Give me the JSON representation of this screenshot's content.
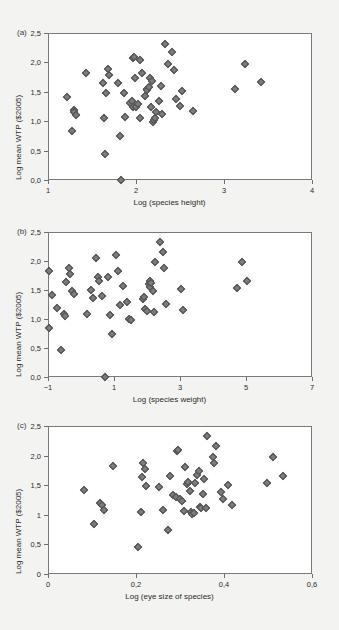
{
  "figure": {
    "background_color": "#f3f3f1",
    "marker_color": "#7c7c7c",
    "marker_edge_color": "#4d4d4d",
    "axis_color": "#6e6e6e",
    "plot_background": "#ffffff"
  },
  "chart_data": [
    {
      "type": "scatter",
      "panel_label": "(a)",
      "title": "",
      "xlabel": "Log (species height)",
      "ylabel": "Log mean WTP ($2005)",
      "xlim": [
        1,
        4
      ],
      "ylim": [
        0.0,
        2.5
      ],
      "xticks": [
        1,
        2,
        3,
        4
      ],
      "xticklabels": [
        "1",
        "2",
        "3",
        "4"
      ],
      "yticks": [
        0.0,
        0.5,
        1.0,
        1.5,
        2.0,
        2.5
      ],
      "yticklabels": [
        "0,0",
        "0,5",
        "1,0",
        "1,5",
        "2,0",
        "2,5"
      ],
      "grid": false,
      "legend": "none",
      "points": [
        [
          1.21,
          1.42
        ],
        [
          1.27,
          0.84
        ],
        [
          1.29,
          1.19
        ],
        [
          1.3,
          1.16
        ],
        [
          1.32,
          1.1
        ],
        [
          1.43,
          1.82
        ],
        [
          1.63,
          1.65
        ],
        [
          1.64,
          1.05
        ],
        [
          1.65,
          0.45
        ],
        [
          1.66,
          1.48
        ],
        [
          1.68,
          1.89
        ],
        [
          1.69,
          1.78
        ],
        [
          1.8,
          1.65
        ],
        [
          1.82,
          0.75
        ],
        [
          1.83,
          0.0
        ],
        [
          1.86,
          1.48
        ],
        [
          1.88,
          1.08
        ],
        [
          1.93,
          1.31
        ],
        [
          1.95,
          1.35
        ],
        [
          1.96,
          1.25
        ],
        [
          1.97,
          2.08
        ],
        [
          1.98,
          2.1
        ],
        [
          1.99,
          1.73
        ],
        [
          2.0,
          1.24
        ],
        [
          2.02,
          1.3
        ],
        [
          2.04,
          2.05
        ],
        [
          2.05,
          1.06
        ],
        [
          2.07,
          1.82
        ],
        [
          2.1,
          1.43
        ],
        [
          2.12,
          1.55
        ],
        [
          2.13,
          1.53
        ],
        [
          2.15,
          1.58
        ],
        [
          2.16,
          1.73
        ],
        [
          2.17,
          1.24
        ],
        [
          2.18,
          1.68
        ],
        [
          2.19,
          0.98
        ],
        [
          2.2,
          1.02
        ],
        [
          2.21,
          1.05
        ],
        [
          2.23,
          1.15
        ],
        [
          2.26,
          1.35
        ],
        [
          2.28,
          1.6
        ],
        [
          2.3,
          1.12
        ],
        [
          2.33,
          2.32
        ],
        [
          2.36,
          1.98
        ],
        [
          2.41,
          2.17
        ],
        [
          2.43,
          1.88
        ],
        [
          2.45,
          1.38
        ],
        [
          2.5,
          1.26
        ],
        [
          2.52,
          1.51
        ],
        [
          2.65,
          1.17
        ],
        [
          3.13,
          1.54
        ],
        [
          3.24,
          1.98
        ],
        [
          3.42,
          1.66
        ]
      ]
    },
    {
      "type": "scatter",
      "panel_label": "(b)",
      "title": "",
      "xlabel": "Log (species weight)",
      "ylabel": "Log mean WTP ($2005)",
      "xlim": [
        -1,
        7
      ],
      "ylim": [
        0.0,
        2.5
      ],
      "xticks": [
        -1,
        1,
        3,
        5,
        7
      ],
      "xticklabels": [
        "−1",
        "1",
        "3",
        "5",
        "7"
      ],
      "yticks": [
        0.0,
        0.5,
        1.0,
        1.5,
        2.0,
        2.5
      ],
      "yticklabels": [
        "0,0",
        "0,5",
        "1,0",
        "1,5",
        "2,0",
        "2,5"
      ],
      "grid": false,
      "legend": "none",
      "points": [
        [
          -0.98,
          1.82
        ],
        [
          -0.97,
          0.84
        ],
        [
          -0.88,
          1.42
        ],
        [
          -0.72,
          1.19
        ],
        [
          -0.6,
          0.46
        ],
        [
          -0.52,
          1.08
        ],
        [
          -0.5,
          1.06
        ],
        [
          -0.45,
          1.64
        ],
        [
          -0.38,
          1.88
        ],
        [
          -0.32,
          1.78
        ],
        [
          -0.28,
          1.48
        ],
        [
          -0.22,
          1.44
        ],
        [
          0.18,
          1.09
        ],
        [
          0.3,
          1.5
        ],
        [
          0.35,
          1.37
        ],
        [
          0.45,
          2.06
        ],
        [
          0.52,
          1.72
        ],
        [
          0.55,
          1.65
        ],
        [
          0.62,
          1.4
        ],
        [
          0.72,
          0.0
        ],
        [
          0.82,
          1.73
        ],
        [
          0.88,
          1.07
        ],
        [
          0.95,
          0.75
        ],
        [
          1.05,
          2.1
        ],
        [
          1.12,
          1.82
        ],
        [
          1.18,
          1.24
        ],
        [
          1.28,
          1.57
        ],
        [
          1.4,
          1.3
        ],
        [
          1.45,
          1.0
        ],
        [
          1.5,
          0.98
        ],
        [
          1.88,
          1.35
        ],
        [
          1.92,
          1.38
        ],
        [
          1.95,
          1.17
        ],
        [
          2.0,
          1.14
        ],
        [
          2.05,
          1.6
        ],
        [
          2.08,
          1.55
        ],
        [
          2.1,
          1.65
        ],
        [
          2.12,
          1.62
        ],
        [
          2.18,
          1.48
        ],
        [
          2.22,
          1.12
        ],
        [
          2.25,
          1.98
        ],
        [
          2.4,
          2.32
        ],
        [
          2.48,
          2.16
        ],
        [
          2.52,
          1.88
        ],
        [
          2.58,
          1.26
        ],
        [
          3.02,
          1.51
        ],
        [
          3.1,
          1.16
        ],
        [
          4.72,
          1.54
        ],
        [
          4.88,
          1.98
        ],
        [
          5.02,
          1.66
        ]
      ]
    },
    {
      "type": "scatter",
      "panel_label": "(c)",
      "title": "",
      "xlabel": "Log (eye size of species)",
      "ylabel": "Log mean WTP ($2005)",
      "xlim": [
        0,
        0.6
      ],
      "ylim": [
        0,
        2.5
      ],
      "xticks": [
        0,
        0.2,
        0.4,
        0.6
      ],
      "xticklabels": [
        "0",
        "0,2",
        "0,4",
        "0,6"
      ],
      "yticks": [
        0,
        0.5,
        1,
        1.5,
        2.0,
        2.5
      ],
      "yticklabels": [
        "0",
        "0,5",
        "1",
        "1,5",
        "2,0",
        "2,5"
      ],
      "grid": false,
      "legend": "none",
      "points": [
        [
          0.082,
          1.42
        ],
        [
          0.105,
          0.84
        ],
        [
          0.118,
          1.2
        ],
        [
          0.122,
          1.17
        ],
        [
          0.128,
          1.09
        ],
        [
          0.148,
          1.83
        ],
        [
          0.205,
          0.46
        ],
        [
          0.212,
          1.05
        ],
        [
          0.214,
          1.64
        ],
        [
          0.216,
          1.88
        ],
        [
          0.22,
          1.78
        ],
        [
          0.222,
          1.48
        ],
        [
          0.252,
          1.47
        ],
        [
          0.262,
          1.08
        ],
        [
          0.272,
          0.75
        ],
        [
          0.278,
          1.65
        ],
        [
          0.285,
          1.34
        ],
        [
          0.29,
          1.3
        ],
        [
          0.292,
          2.08
        ],
        [
          0.296,
          2.1
        ],
        [
          0.3,
          1.26
        ],
        [
          0.305,
          1.24
        ],
        [
          0.308,
          1.07
        ],
        [
          0.312,
          1.81
        ],
        [
          0.315,
          1.52
        ],
        [
          0.318,
          1.55
        ],
        [
          0.322,
          1.41
        ],
        [
          0.325,
          1.05
        ],
        [
          0.328,
          1.01
        ],
        [
          0.332,
          1.03
        ],
        [
          0.335,
          1.53
        ],
        [
          0.338,
          1.68
        ],
        [
          0.342,
          1.74
        ],
        [
          0.345,
          1.14
        ],
        [
          0.348,
          1.11
        ],
        [
          0.352,
          1.35
        ],
        [
          0.355,
          1.6
        ],
        [
          0.358,
          1.12
        ],
        [
          0.362,
          2.33
        ],
        [
          0.375,
          1.98
        ],
        [
          0.378,
          1.88
        ],
        [
          0.382,
          2.16
        ],
        [
          0.392,
          1.38
        ],
        [
          0.398,
          1.26
        ],
        [
          0.408,
          1.51
        ],
        [
          0.418,
          1.16
        ],
        [
          0.498,
          1.54
        ],
        [
          0.512,
          1.98
        ],
        [
          0.535,
          1.66
        ]
      ]
    }
  ]
}
